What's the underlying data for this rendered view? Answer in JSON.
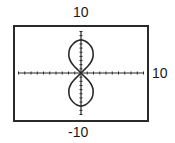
{
  "chart_data": {
    "type": "line",
    "title": "",
    "xlabel": "",
    "ylabel": "",
    "window": {
      "xmin": -10,
      "xmax": 10,
      "ymin": -10,
      "ymax": 10,
      "xscl": 1,
      "yscl": 1
    },
    "labels": {
      "ymax": "10",
      "xmax": "10",
      "ymin": "-10"
    },
    "grid": false,
    "legend": null,
    "series": [
      {
        "name": "polar figure-eight (vertical)",
        "description": "Two symmetric loops above and below origin, crossing at origin",
        "points_quadrant1": [
          [
            0,
            0
          ],
          [
            0.48,
            0.72
          ],
          [
            1.12,
            1.69
          ],
          [
            1.6,
            2.65
          ],
          [
            1.92,
            3.86
          ],
          [
            1.92,
            5.06
          ],
          [
            1.76,
            6.02
          ],
          [
            1.28,
            6.99
          ],
          [
            0.64,
            7.71
          ],
          [
            0,
            7.95
          ]
        ],
        "symmetry": "mirrored across both axes"
      }
    ]
  },
  "colors": {
    "frame": "#2a2a2a",
    "axis": "#2a2a2a",
    "curve": "#2a2a2a",
    "text": "#1a1a1a"
  },
  "layout_px": {
    "frame": {
      "x": 14,
      "y": 26,
      "w": 134,
      "h": 95
    },
    "origin": {
      "x": 81,
      "y": 73
    },
    "x_axis": {
      "x1": 18,
      "x2": 143
    },
    "y_axis": {
      "y1": 32,
      "y2": 115
    },
    "px_per_unit_x": 6.25,
    "px_per_unit_y": 4.15
  }
}
